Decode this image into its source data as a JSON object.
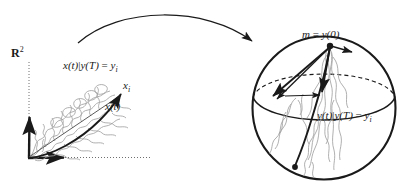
{
  "figure": {
    "width": 413,
    "height": 187,
    "background": "#ffffff",
    "ink_color": "#1a1a1a",
    "noise_color": "#9a9a9a"
  },
  "left_panel": {
    "space_label": "R",
    "space_exponent": "2",
    "axes": {
      "origin": "(28,158)",
      "vertical_arrow_tip": "(30,113)",
      "horizontal_arrow_tip": "(68,157)",
      "dotted_style": "dotted"
    },
    "conditional_path_label": {
      "fn": "x(t)",
      "bar": "|",
      "cond": "y(T)",
      "eq": " = ",
      "target": "y",
      "target_sub": "i"
    },
    "endpoint_label": {
      "base": "x",
      "sub": "i"
    },
    "drift_label": {
      "text": "x(t)"
    }
  },
  "right_panel": {
    "sphere": {
      "center_x": 324,
      "center_y": 108,
      "radius": 72,
      "equator_style": "front-solid back-dashed"
    },
    "start_point_label": {
      "base": "m",
      "eq": " = ",
      "fn": "y(0)"
    },
    "conditional_path_label": {
      "fn": "y(t)",
      "bar": "|",
      "cond": "y(T)",
      "eq": " = ",
      "target": "y",
      "target_sub": "i"
    }
  },
  "connector": {
    "type": "curved-arrow",
    "from": "(78,43)",
    "to": "(256,46)",
    "direction": "left-to-right"
  }
}
